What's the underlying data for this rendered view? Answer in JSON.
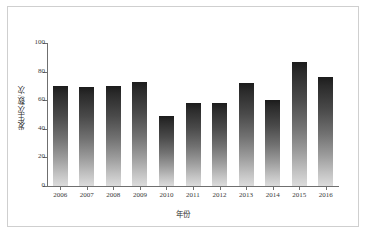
{
  "chart_data": {
    "type": "bar",
    "title": "",
    "xlabel": "年份",
    "ylabel": "发生次数/次",
    "categories": [
      "2006",
      "2007",
      "2008",
      "2009",
      "2010",
      "2011",
      "2012",
      "2013",
      "2014",
      "2015",
      "2016"
    ],
    "values": [
      70,
      69,
      70,
      73,
      49,
      58,
      58,
      72,
      60,
      87,
      76
    ],
    "ylim": [
      0,
      100
    ],
    "yticks": [
      0,
      20,
      40,
      60,
      80,
      100
    ],
    "grid": false,
    "legend": false,
    "series": [
      {
        "name": "发生次数",
        "values": [
          70,
          69,
          70,
          73,
          49,
          58,
          58,
          72,
          60,
          87,
          76
        ]
      }
    ],
    "bar_style": {
      "fill": "vertical-gradient",
      "color_top": "#1c1c1c",
      "color_bottom": "#dcdcdc",
      "shadow_color": "#d6d6d6"
    },
    "axis_color": "#6f6f6f",
    "frame_color": "#cfcfcf",
    "background": "#ffffff"
  }
}
